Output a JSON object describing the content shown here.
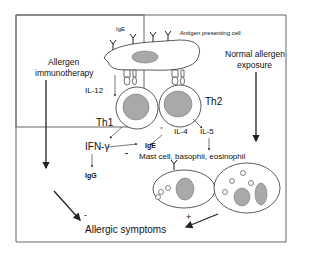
{
  "diagram": {
    "labels": {
      "ige_top": "IgE",
      "apc": "Antigen presenting cell",
      "allergen_immunotherapy_1": "Allergen",
      "allergen_immunotherapy_2": "immunotherapy",
      "normal_exposure_1": "Normal allergen",
      "normal_exposure_2": "exposure",
      "il12": "IL-12",
      "th1": "Th1",
      "th2": "Th2",
      "il4": "IL-4",
      "il5": "IL-5",
      "ifn": "IFN-γ",
      "ige_mid": "IgE",
      "igg": "IgG",
      "effector_cells": "Mast cell, basophil, eosinophil",
      "minus_ifn": "-",
      "minus_symptoms": "-",
      "plus_symptoms": "+",
      "allergic_symptoms": "Allergic symptoms"
    },
    "colors": {
      "line": "#222222",
      "nucleus": "#a9a9a9",
      "frame": "#555555"
    }
  }
}
